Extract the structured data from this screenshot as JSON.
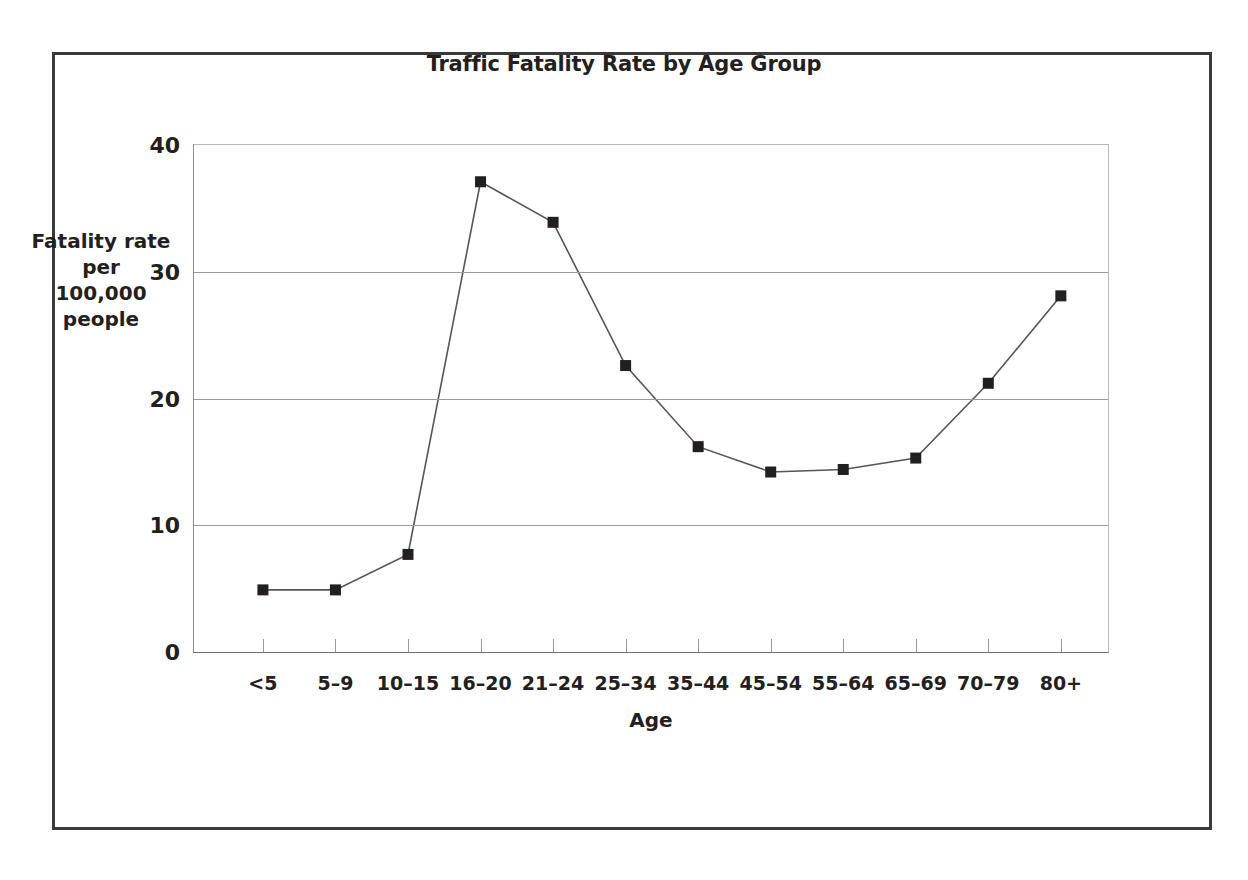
{
  "figure": {
    "title": "Traffic Fatality Rate by Age Group",
    "y_axis_title_lines": [
      "Fatality rate",
      "per",
      "100,000",
      "people"
    ],
    "x_axis_title": "Age",
    "frame_color": "#3a3a3c",
    "marker_color": "#231f20",
    "line_color": "#55555a",
    "grid_color": "#9a9a9c"
  },
  "chart_data": {
    "type": "line",
    "title": "Traffic Fatality Rate by Age Group",
    "xlabel": "Age",
    "ylabel": "Fatality rate per 100,000 people",
    "categories": [
      "<5",
      "5–9",
      "10–15",
      "16–20",
      "21–24",
      "25–34",
      "35–44",
      "45–54",
      "55–64",
      "65–69",
      "70–79",
      "80+"
    ],
    "values": [
      4.9,
      4.9,
      7.7,
      37.1,
      33.9,
      22.6,
      16.2,
      14.2,
      14.4,
      15.3,
      21.2,
      28.1
    ],
    "ylim": [
      0,
      40
    ],
    "yticks": [
      0,
      10,
      20,
      30,
      40
    ],
    "ytick_labels": [
      "0",
      "10",
      "20",
      "30",
      "40"
    ],
    "grid": "horizontal",
    "legend": "none",
    "marker": "square",
    "series": [
      {
        "name": "Fatality rate per 100,000 people",
        "values": [
          4.9,
          4.9,
          7.7,
          37.1,
          33.9,
          22.6,
          16.2,
          14.2,
          14.4,
          15.3,
          21.2,
          28.1
        ]
      }
    ]
  }
}
